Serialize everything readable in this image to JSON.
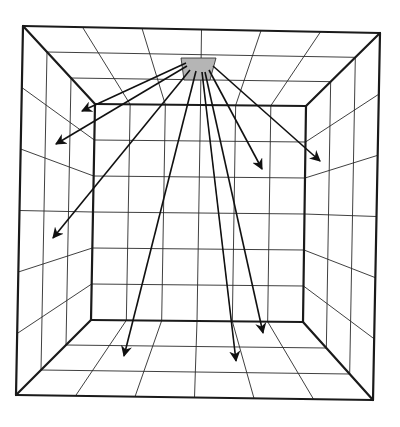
{
  "diagram": {
    "type": "perspective-room-light-rays",
    "colors": {
      "line": "#1a1a1a",
      "light_patch": "#b5b5b5",
      "background": "#ffffff"
    },
    "outer": {
      "tl": [
        23,
        26
      ],
      "tr": [
        380,
        33
      ],
      "br": [
        373,
        400
      ],
      "bl": [
        16,
        395
      ]
    },
    "inner": {
      "tl": [
        95,
        104
      ],
      "tr": [
        306,
        106
      ],
      "br": [
        303,
        322
      ],
      "bl": [
        91,
        320
      ]
    },
    "divisions": 6,
    "light_source": {
      "points": [
        [
          181,
          58
        ],
        [
          216,
          58
        ],
        [
          210,
          80
        ],
        [
          184,
          80
        ]
      ]
    },
    "rays": [
      {
        "from": [
          186,
          63
        ],
        "to": [
          82,
          111
        ]
      },
      {
        "from": [
          187,
          66
        ],
        "to": [
          56,
          144
        ]
      },
      {
        "from": [
          190,
          70
        ],
        "to": [
          53,
          238
        ]
      },
      {
        "from": [
          196,
          71
        ],
        "to": [
          124,
          356
        ]
      },
      {
        "from": [
          202,
          72
        ],
        "to": [
          236,
          361
        ]
      },
      {
        "from": [
          205,
          72
        ],
        "to": [
          263,
          333
        ]
      },
      {
        "from": [
          209,
          70
        ],
        "to": [
          262,
          169
        ]
      },
      {
        "from": [
          213,
          66
        ],
        "to": [
          320,
          161
        ]
      }
    ]
  }
}
